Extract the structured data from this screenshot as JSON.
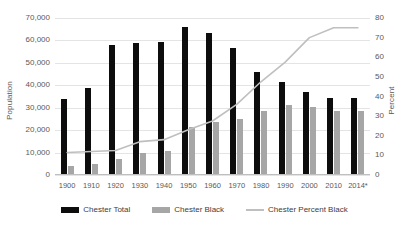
{
  "chart_data": {
    "type": "bar",
    "title": "",
    "subtitle": "",
    "xlabel": "",
    "ylabel": "Population",
    "y2label": "Percent",
    "ylim": [
      0,
      70000
    ],
    "y2lim": [
      0,
      80
    ],
    "grid": true,
    "legend_position": "bottom",
    "categories": [
      "1900",
      "1910",
      "1920",
      "1930",
      "1940",
      "1950",
      "1960",
      "1970",
      "1980",
      "1990",
      "2000",
      "2010",
      "2014*"
    ],
    "y_ticks_left": [
      "0",
      "10,000",
      "20,000",
      "30,000",
      "40,000",
      "50,000",
      "60,000",
      "70,000"
    ],
    "y_ticks_right": [
      "0",
      "10",
      "20",
      "30",
      "40",
      "50",
      "60",
      "70",
      "80"
    ],
    "series": [
      {
        "name": "Chester Total",
        "type": "bar",
        "axis": "left",
        "color": "#0d0d0d",
        "values": [
          34000,
          39000,
          58000,
          59000,
          59500,
          66000,
          63500,
          56500,
          46000,
          41500,
          37000,
          34500,
          34500
        ]
      },
      {
        "name": "Chester Black",
        "type": "bar",
        "axis": "left",
        "color": "#a6a6a6",
        "values": [
          4000,
          5000,
          7000,
          10000,
          10500,
          21500,
          23500,
          25000,
          28500,
          31000,
          30500,
          28500,
          28500
        ]
      },
      {
        "name": "Chester Percent Black",
        "type": "line",
        "axis": "right",
        "color": "#bfbfbf",
        "values": [
          11.5,
          12.0,
          12.5,
          17.0,
          18.0,
          23.0,
          27.5,
          36.0,
          47.5,
          57.5,
          70.0,
          75.0,
          75.0
        ]
      }
    ]
  },
  "legend": {
    "items": [
      {
        "label": "Chester Total",
        "swatch": "bar-black-swatch"
      },
      {
        "label": "Chester Black",
        "swatch": "bar-gray-swatch"
      },
      {
        "label": "Chester Percent Black",
        "swatch": "line-gray-swatch"
      }
    ]
  }
}
